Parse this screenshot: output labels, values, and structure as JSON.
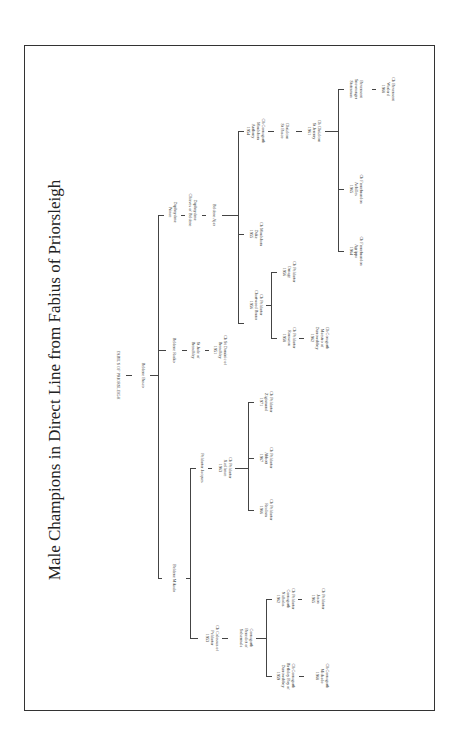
{
  "title": "Male Champions in Direct Line from Fabius of Priorsleigh",
  "nodes": {
    "fabius": "FABIUS OF PRIORSLEIGH",
    "busco": "Beldene Busco",
    "rasko": "Beldene Rasko",
    "jude": "St Jude of\nBrenchley",
    "dominic": "Ch St Dominic of\nBrenchley\n1951",
    "dp_prince": "Daphnydene\nPrince",
    "dp_chieves": "Daphnydene\nChieves of Beldene",
    "ajax": "Beldene Ajax",
    "moulsham_duke": "Ch Moulsham\nDuke\n1955",
    "chartwood": "Ch Peldartor\nChartwood Bruno\n1956",
    "ornage": "Ch Peldartor\nOrnage\n1956",
    "rousseau": "Ch Peldartor\nRousseau\n1958",
    "maestro": "Ch Coragarth\nMaestro of\nDurrowabbey\n1962",
    "anthony": "Ch Cornagarth\nMoulsham\nAnthony\n1954",
    "st_basco": "Chrizlcon\nSt Basco",
    "st_jeremy": "Ch Chrizlcon\nSt Jeremy\n1961",
    "agrippa": "Ch Fernebrandon\nAgrippa\n1964",
    "achilles": "Ch Fernebrandon\nAchilles\n1965",
    "statesman": "Bevensent\nSnowranger\nStatesman",
    "warlord": "Ch Bevensent\nWarlord\n1968",
    "mikado": "Beldene Mikado",
    "jacques": "Peldartor Jacques",
    "xcellence": "Ch Peldartor\nXcellence\n1963",
    "realism": "Ch Peldartor\nRealism\n1966",
    "abbott": "Ch Peldartor\nAbbott\n1967",
    "zigismund": "Ch Peldartor\nZigismund\n1971",
    "colossus": "Ch Colossus of\nPeldartor\n1953",
    "benedict": "Cornagarth\nBenedict of\nSolsermala",
    "birthday_boy": "Ch Cornagarth\nBirthday Boy of\nDurrowabbey\n1959",
    "mic_kado": "Ch Cornagarth\nMickado\n1968",
    "nicholas": "Ch Peldartor\nCornagarth\nNicholas\n1962",
    "jason": "Ch Peldartor\nJason\n1965"
  }
}
